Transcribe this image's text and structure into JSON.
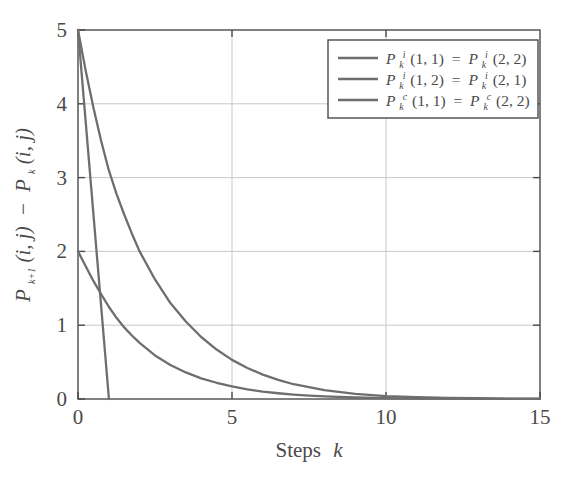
{
  "chart_data": {
    "type": "line",
    "title": "",
    "xlabel": "Steps k",
    "ylabel": "P_{k+1}(i, j) - P_k(i, j)",
    "xlim": [
      0,
      15
    ],
    "ylim": [
      0,
      5
    ],
    "xticks": [
      "0",
      "5",
      "10",
      "15"
    ],
    "xtick_values": [
      0,
      5,
      10,
      15
    ],
    "yticks": [
      "0",
      "1",
      "2",
      "3",
      "4",
      "5"
    ],
    "ytick_values": [
      0,
      1,
      2,
      3,
      4,
      5
    ],
    "grid": true,
    "legend_position": "upper-right",
    "series": [
      {
        "name": "P_k^i(1, 1) = P_k^i(2, 2)",
        "color": "#6e6e6e",
        "x": [
          0,
          0.25,
          0.5,
          0.75,
          1,
          1.25,
          1.5,
          1.75,
          2,
          2.5,
          3,
          3.5,
          4,
          4.5,
          5,
          5.5,
          6,
          6.5,
          7,
          7.5,
          8,
          9,
          10,
          11,
          12,
          13,
          14,
          15
        ],
        "y": [
          5.0,
          4.45,
          3.95,
          3.5,
          3.1,
          2.78,
          2.5,
          2.24,
          2.0,
          1.62,
          1.3,
          1.05,
          0.84,
          0.67,
          0.53,
          0.42,
          0.33,
          0.26,
          0.2,
          0.16,
          0.12,
          0.07,
          0.04,
          0.025,
          0.015,
          0.01,
          0.006,
          0.004
        ]
      },
      {
        "name": "P_k^i(1, 2) = P_k^i(2, 1)",
        "color": "#6e6e6e",
        "x": [
          0,
          0.25,
          0.5,
          0.75,
          1,
          1.25,
          1.5,
          1.75,
          2,
          2.5,
          3,
          3.5,
          4,
          4.5,
          5,
          5.5,
          6,
          6.5,
          7,
          7.5,
          8,
          9,
          10,
          11,
          12,
          13,
          14,
          15
        ],
        "y": [
          2.0,
          1.8,
          1.6,
          1.42,
          1.25,
          1.1,
          0.97,
          0.86,
          0.76,
          0.59,
          0.46,
          0.36,
          0.28,
          0.22,
          0.17,
          0.13,
          0.1,
          0.078,
          0.06,
          0.046,
          0.035,
          0.02,
          0.012,
          0.007,
          0.004,
          0.0025,
          0.0015,
          0.001
        ]
      },
      {
        "name": "P_k^c(1, 1) = P_k^c(2, 2)",
        "color": "#6e6e6e",
        "x": [
          0,
          1,
          1
        ],
        "y": [
          5.0,
          0.02,
          0.0
        ]
      }
    ]
  },
  "legend": {
    "entries": [
      {
        "base": "P",
        "sub": "k",
        "sup": "i",
        "args1": "(1, 1)",
        "eq": "=",
        "base2": "P",
        "sub2": "k",
        "sup2": "i",
        "args2": "(2, 2)",
        "full": "P_k^i(1, 1) = P_k^i(2, 2)"
      },
      {
        "base": "P",
        "sub": "k",
        "sup": "i",
        "args1": "(1, 2)",
        "eq": "=",
        "base2": "P",
        "sub2": "k",
        "sup2": "i",
        "args2": "(2, 1)",
        "full": "P_k^i(1, 2) = P_k^i(2, 1)"
      },
      {
        "base": "P",
        "sub": "k",
        "sup": "c",
        "args1": "(1, 1)",
        "eq": "=",
        "base2": "P",
        "sub2": "k",
        "sup2": "c",
        "args2": "(2, 2)",
        "full": "P_k^c(1, 1) = P_k^c(2, 2)"
      }
    ]
  },
  "axes": {
    "xlabel_word": "Steps",
    "xlabel_var": "k",
    "ylabel_parts": {
      "p1": "P",
      "p1sub": "k+1",
      "p1args": "(i, j)",
      "minus": "−",
      "p2": "P",
      "p2sub": "k",
      "p2args": "(i, j)"
    }
  },
  "colors": {
    "line": "#6e6e6e",
    "grid": "#c9c9c9",
    "frame": "#4a4a4a",
    "text": "#4a4a4a",
    "background": "#ffffff"
  }
}
